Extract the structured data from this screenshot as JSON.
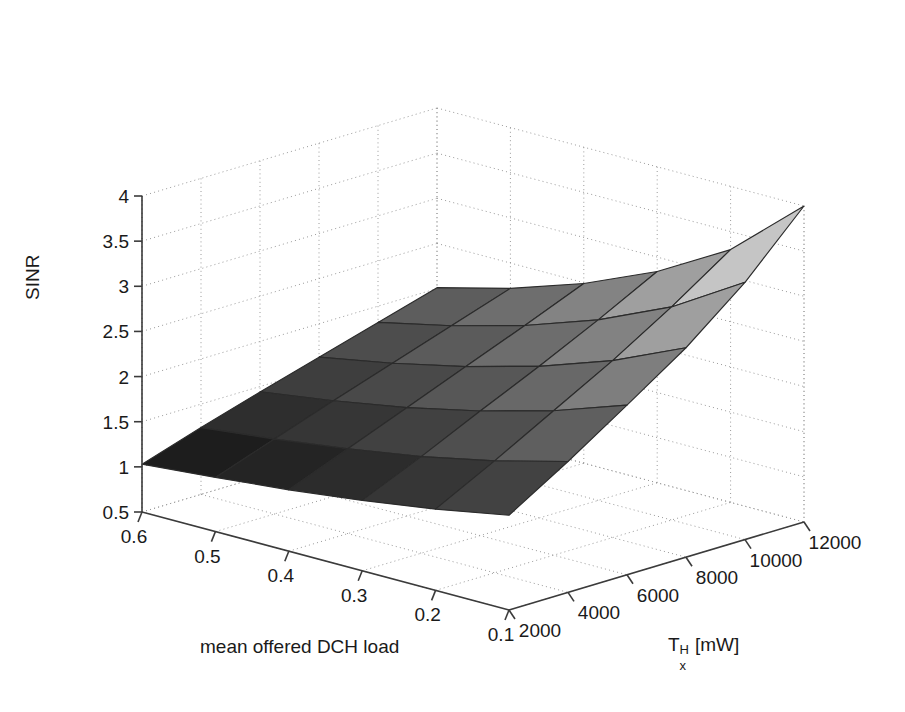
{
  "chart_data": {
    "type": "surface",
    "title": "",
    "xlabel": "mean offered DCH load",
    "ylabel": "T_x^H [mW]",
    "zlabel": "SINR",
    "grid": true,
    "legend": null,
    "projection": "3d",
    "x": [
      0.1,
      0.2,
      0.3,
      0.4,
      0.5,
      0.6
    ],
    "y": [
      2000,
      4000,
      6000,
      8000,
      10000,
      12000
    ],
    "xlim": [
      0.1,
      0.6
    ],
    "ylim": [
      2000,
      12000
    ],
    "zlim": [
      0.5,
      4
    ],
    "x_ticks": [
      "0.6",
      "0.5",
      "0.4",
      "0.3",
      "0.2",
      "0.1"
    ],
    "y_ticks": [
      "2000",
      "4000",
      "6000",
      "8000",
      "10000",
      "12000"
    ],
    "z_ticks": [
      "0.5",
      "1",
      "1.5",
      "2",
      "2.5",
      "3",
      "3.5",
      "4"
    ],
    "x_tick_values": [
      0.6,
      0.5,
      0.4,
      0.3,
      0.2,
      0.1
    ],
    "y_tick_values": [
      2000,
      4000,
      6000,
      8000,
      10000,
      12000
    ],
    "z_tick_values": [
      0.5,
      1,
      1.5,
      2,
      2.5,
      3,
      3.5,
      4
    ],
    "colormap": "gray",
    "z_matrix_note": "rows = y (Tx power 2000..12000), cols = x (DCH load 0.1..0.6); SINR decreases with load and increases with Tx power",
    "z": [
      [
        1.55,
        1.4,
        1.28,
        1.18,
        1.1,
        1.03
      ],
      [
        1.95,
        1.74,
        1.57,
        1.44,
        1.33,
        1.24
      ],
      [
        2.38,
        2.1,
        1.88,
        1.7,
        1.56,
        1.44
      ],
      [
        2.82,
        2.46,
        2.18,
        1.96,
        1.78,
        1.63
      ],
      [
        3.35,
        2.86,
        2.5,
        2.22,
        2.0,
        1.82
      ],
      [
        4.0,
        3.3,
        2.84,
        2.49,
        2.22,
        2.01
      ]
    ],
    "view": {
      "azimuth": -37.5,
      "elevation": 30
    }
  },
  "axes": {
    "z_axis_label": "SINR",
    "x_axis_label": "mean offered DCH load",
    "y_axis_label_base": "T",
    "y_axis_label_sup": "H",
    "y_axis_label_sub": "x",
    "y_axis_label_unit": "[mW]"
  },
  "style": {
    "background": "#ffffff",
    "axis_color": "#3b3b3b",
    "grid_color": "#9a9a9a",
    "mesh_line_color": "#2b2b2b",
    "surface_dark": "#1c1c1c",
    "surface_light": "#f2f2f2"
  }
}
